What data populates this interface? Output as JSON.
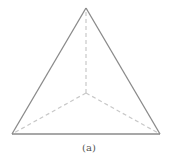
{
  "figure": {
    "caption": "(a)",
    "colors": {
      "solid_edge": "#8a8a8a",
      "hidden_edge": "#c8c8c8",
      "caption": "#555555"
    },
    "vertices": {
      "top": [
        86,
        8
      ],
      "bottom_left": [
        12,
        134
      ],
      "bottom_right": [
        160,
        134
      ],
      "center": [
        86,
        93
      ]
    },
    "solid_edges": [
      [
        "top",
        "bottom_left"
      ],
      [
        "top",
        "bottom_right"
      ],
      [
        "bottom_left",
        "bottom_right"
      ]
    ],
    "dashed_edges": [
      [
        "center",
        "top"
      ],
      [
        "center",
        "bottom_left"
      ],
      [
        "center",
        "bottom_right"
      ]
    ]
  }
}
